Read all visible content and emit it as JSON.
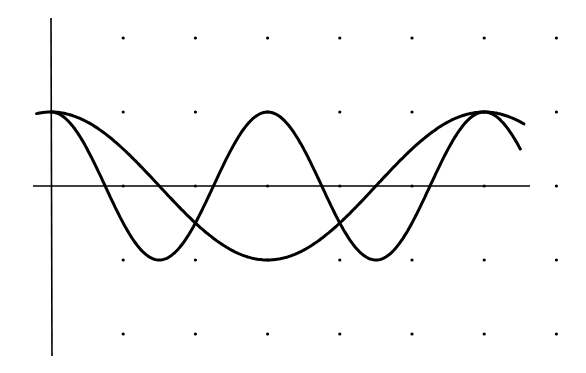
{
  "chart_data": {
    "type": "line",
    "title": "",
    "xlabel": "",
    "ylabel": "",
    "grid": "dots",
    "x_unit": "pi/3 per grid step",
    "xlim": [
      -0.25,
      7.25
    ],
    "ylim": [
      -2.0,
      2.25
    ],
    "x_ticks_grid": [
      1,
      2,
      3,
      4,
      5,
      6,
      7
    ],
    "y_ticks_grid": [
      2,
      1,
      0,
      -1,
      -2
    ],
    "series": [
      {
        "name": "cos(x)",
        "description": "long-period curve, peak at 0, min at x=pi (grid 3), peak at 2pi (grid 6)",
        "x_grid_range": [
          -0.2,
          6.55
        ],
        "amplitude": 1,
        "frequency": 1,
        "color": "#000000"
      },
      {
        "name": "cos(2x)",
        "description": "short-period curve, peaks at 0, pi (grid 3), 2pi (grid 6); mins at grid 1.5, 4.5",
        "x_grid_range": [
          0,
          6.5
        ],
        "amplitude": 1,
        "frequency": 2,
        "color": "#000000"
      }
    ]
  },
  "style": {
    "axis_color": "#000000",
    "dot_color": "#000000",
    "background": "#ffffff"
  }
}
